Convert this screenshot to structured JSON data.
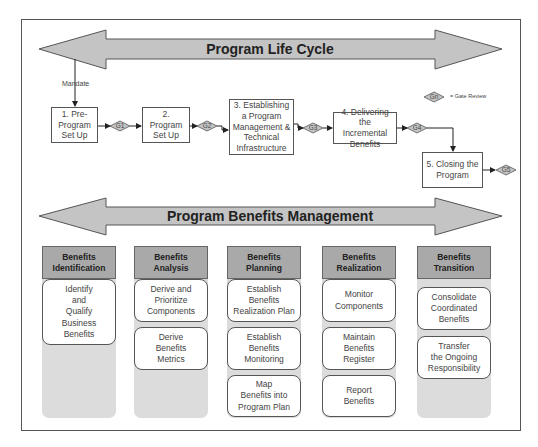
{
  "lifecycle": {
    "title": "Program Life Cycle",
    "mandate_label": "Mandate",
    "steps": [
      {
        "label": "1. Pre-\nProgram\nSet Up"
      },
      {
        "label": "2. Program\nSet Up"
      },
      {
        "label": "3. Establishing\na Program\nManagement &\nTechnical\nInfrastructure"
      },
      {
        "label": "4. Delivering\nthe Incremental\nBenefits"
      },
      {
        "label": "5. Closing the\nProgram"
      }
    ],
    "gates": [
      "G1",
      "G2",
      "G3",
      "G4",
      "G5"
    ],
    "legend": {
      "symbol": "Gn",
      "text": "= Gate Review"
    }
  },
  "benefits": {
    "title": "Program Benefits Management",
    "columns": [
      {
        "header": "Benefits\nIdentification",
        "items": [
          "Identify\nand\nQualify\nBusiness\nBenefits"
        ]
      },
      {
        "header": "Benefits\nAnalysis",
        "items": [
          "Derive and\nPrioritize\nComponents",
          "Derive\nBenefits\nMetrics"
        ]
      },
      {
        "header": "Benefits\nPlanning",
        "items": [
          "Establish\nBenefits\nRealization Plan",
          "Establish\nBenefits\nMonitoring",
          "Map\nBenefits into\nProgram Plan"
        ]
      },
      {
        "header": "Benefits\nRealization",
        "items": [
          "Monitor\nComponents",
          "Maintain\nBenefits\nRegister",
          "Report\nBenefits"
        ]
      },
      {
        "header": "Benefits\nTransition",
        "items": [
          "Consolidate\nCoordinated\nBenefits",
          "Transfer\nthe Ongoing\nResponsibility"
        ]
      }
    ]
  },
  "colors": {
    "arrow_fill": "#c4c4c4",
    "header_fill": "#a9a9a9",
    "column_fill": "#dcdcdc",
    "stroke": "#555555"
  }
}
